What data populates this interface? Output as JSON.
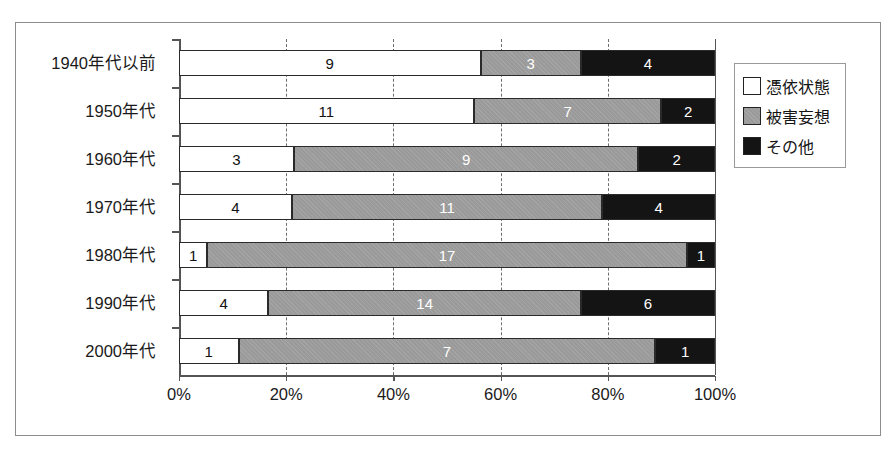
{
  "chart_data": {
    "type": "bar",
    "orientation": "horizontal",
    "stacked": true,
    "normalized": true,
    "title": "",
    "subtitle": "",
    "xlabel": "",
    "ylabel": "",
    "xlim": [
      0,
      100
    ],
    "grid": true,
    "grid_axis": "x",
    "legend_position": "right-top",
    "categories": [
      "1940年代以前",
      "1950年代",
      "1960年代",
      "1970年代",
      "1980年代",
      "1990年代",
      "2000年代"
    ],
    "series": [
      {
        "name": "憑依状態",
        "color": "#ffffff",
        "values": [
          9,
          11,
          3,
          4,
          1,
          4,
          1
        ]
      },
      {
        "name": "被害妄想",
        "color": "#9a9a9a",
        "values": [
          3,
          7,
          9,
          11,
          17,
          14,
          7
        ]
      },
      {
        "name": "その他",
        "color": "#141414",
        "values": [
          4,
          2,
          2,
          4,
          1,
          6,
          1
        ]
      }
    ],
    "row_totals": [
      16,
      20,
      14,
      19,
      19,
      24,
      9
    ],
    "xticks": [
      0,
      20,
      40,
      60,
      80,
      100
    ],
    "xticklabels": [
      "0%",
      "20%",
      "40%",
      "60%",
      "80%",
      "100%"
    ]
  },
  "legend": {
    "items": [
      {
        "label": "憑依状態",
        "swatch": "white-square-icon"
      },
      {
        "label": "被害妄想",
        "swatch": "gray-square-icon"
      },
      {
        "label": "その他",
        "swatch": "black-square-icon"
      }
    ]
  },
  "colors": {
    "series_white": "#ffffff",
    "series_gray": "#9a9a9a",
    "series_black": "#141414",
    "axis": "#545454",
    "frame": "#8d8d8d",
    "text": "#1a1a1a"
  }
}
